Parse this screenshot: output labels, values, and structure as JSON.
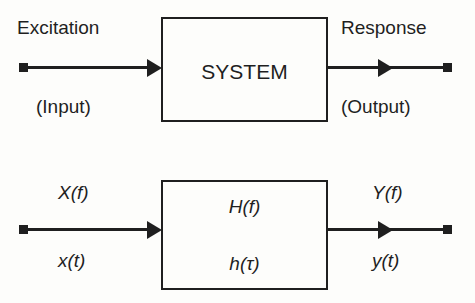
{
  "figure": {
    "type": "block-diagram",
    "background_color": "#fdfdfb",
    "ink_color": "#1f1f1f"
  },
  "diagrams": [
    {
      "id": "top",
      "name": "system-word-diagram",
      "input": {
        "primary_label": "Excitation",
        "secondary_label": "(Input)",
        "terminal": "square-terminal",
        "arrow": "arrow-right"
      },
      "block": {
        "label_top": "SYSTEM",
        "label_bottom": ""
      },
      "output": {
        "primary_label": "Response",
        "secondary_label": "(Output)",
        "terminal": "square-terminal",
        "arrow": "arrow-right"
      }
    },
    {
      "id": "bottom",
      "name": "transfer-function-diagram",
      "input": {
        "primary_label": "X(f)",
        "secondary_label": "x(t)",
        "terminal": "square-terminal",
        "arrow": "arrow-right"
      },
      "block": {
        "label_top": "H(f)",
        "label_bottom": "h(τ)"
      },
      "output": {
        "primary_label": "Y(f)",
        "secondary_label": "y(t)",
        "terminal": "square-terminal",
        "arrow": "arrow-right"
      }
    }
  ]
}
